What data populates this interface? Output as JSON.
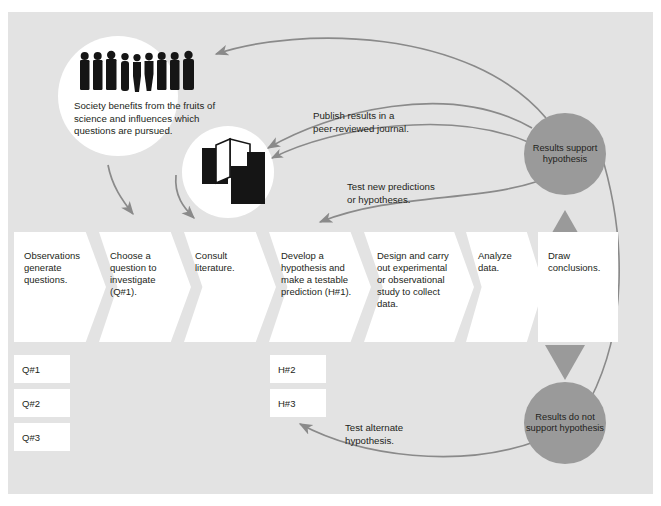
{
  "diagram": {
    "colors": {
      "page_background": "#ffffff",
      "panel_background": "#e3e3e3",
      "node_fill": "#ffffff",
      "circle_fill": "#9a9a9a",
      "arrow_stroke": "#8a8a8a",
      "triangle_fill": "#9a9a9a",
      "text": "#231f20",
      "icon_black": "#151515"
    }
  },
  "society": {
    "icon": "people-silhouettes-icon",
    "people_count": 9,
    "caption": "Society benefits from the fruits of science and influences which questions are pursued."
  },
  "literature": {
    "icon": "books-icon"
  },
  "flow": {
    "steps": [
      {
        "id": "observations",
        "label": "Observations generate questions.",
        "shape": "chevron"
      },
      {
        "id": "choose",
        "label": "Choose a question to investigate (Q#1).",
        "shape": "chevron"
      },
      {
        "id": "consult",
        "label": "Consult literature.",
        "shape": "chevron"
      },
      {
        "id": "hypothesis",
        "label": "Develop a hypothesis and make a testable prediction (H#1).",
        "shape": "chevron"
      },
      {
        "id": "design",
        "label": "Design and carry out experimental or observational study to collect data.",
        "shape": "chevron"
      },
      {
        "id": "analyze",
        "label": "Analyze data.",
        "shape": "chevron"
      },
      {
        "id": "conclusions",
        "label": "Draw conclusions.",
        "shape": "rectangle"
      }
    ]
  },
  "queue": {
    "questions": [
      {
        "id": "q1",
        "label": "Q#1"
      },
      {
        "id": "q2",
        "label": "Q#2"
      },
      {
        "id": "q3",
        "label": "Q#3"
      }
    ],
    "hypotheses": [
      {
        "id": "h2",
        "label": "H#2"
      },
      {
        "id": "h3",
        "label": "H#3"
      }
    ]
  },
  "outcomes": [
    {
      "id": "support",
      "label": "Results support hypothesis"
    },
    {
      "id": "not-support",
      "label": "Results do not support hypothesis"
    }
  ],
  "annotations": [
    {
      "id": "publish",
      "line1": "Publish results in a",
      "line2": "peer-reviewed journal."
    },
    {
      "id": "test-new",
      "line1": "Test new predictions",
      "line2": "or hypotheses."
    },
    {
      "id": "test-alt",
      "line1": "Test alternate",
      "line2": "hypothesis."
    }
  ]
}
